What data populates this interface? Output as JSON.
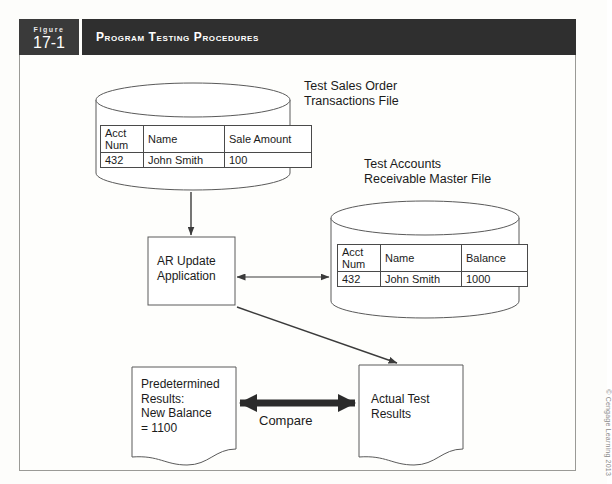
{
  "figure": {
    "label_word": "Figure",
    "number": "17-1",
    "title": "Program Testing Procedures"
  },
  "diagram": {
    "type": "flowchart",
    "labels": {
      "transactions_file": "Test Sales Order\nTransactions File",
      "master_file": "Test Accounts\nReceivable Master File",
      "compare": "Compare"
    },
    "process_box": {
      "name": "AR Update\nApplication"
    },
    "documents": {
      "predetermined": "Predetermined\nResults:\nNew Balance\n= 1100",
      "actual": "Actual Test\nResults"
    },
    "tables": [
      {
        "id": "transactions-table",
        "headers": [
          "Acct\nNum",
          "Name",
          "Sale Amount"
        ],
        "rows": [
          [
            "432",
            "John Smith",
            "100"
          ]
        ]
      },
      {
        "id": "master-table",
        "headers": [
          "Acct\nNum",
          "Name",
          "Balance"
        ],
        "rows": [
          [
            "432",
            "John Smith",
            "1000"
          ]
        ]
      }
    ],
    "connectors": [
      {
        "from": "transactions_file",
        "to": "process_box",
        "kind": "arrow-down"
      },
      {
        "from": "process_box",
        "to": "master_file",
        "kind": "double-arrow"
      },
      {
        "from": "process_box",
        "to": "actual_results",
        "kind": "arrow-diagonal"
      },
      {
        "from": "predetermined_results",
        "to": "actual_results",
        "kind": "double-arrow-thick",
        "label": "Compare"
      }
    ]
  },
  "credit": "© Cengage Learning 2013",
  "colors": {
    "header_bg": "#2f2f2f",
    "header_fignum_bg": "#3a3a3a",
    "header_text": "#ffffff",
    "page_bg": "#fdfdfb",
    "frame_border": "#9a9a96",
    "line": "#3b3b3b",
    "text": "#1b1b1b",
    "credit_text": "#8c8c8c"
  }
}
